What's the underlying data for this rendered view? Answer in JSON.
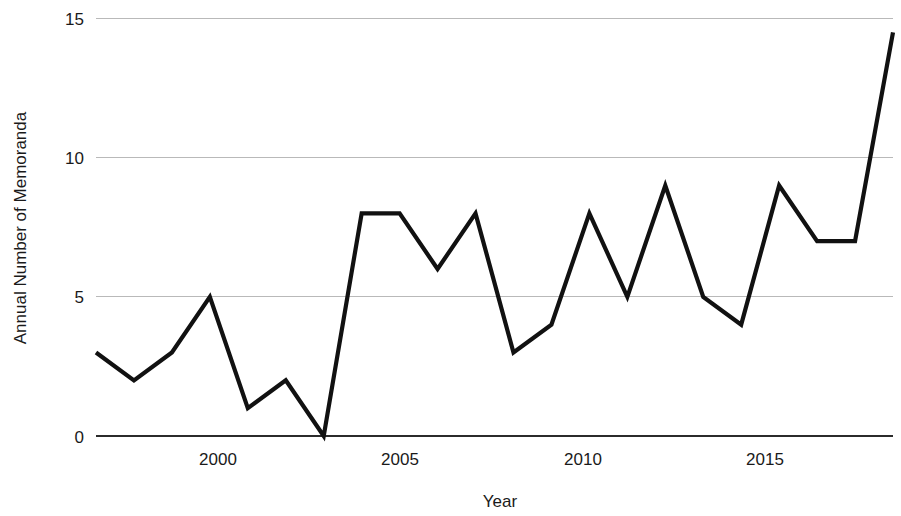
{
  "chart_data": {
    "type": "line",
    "title": "",
    "xlabel": "Year",
    "ylabel": "Annual Number of Memoranda",
    "x": [
      1997,
      1998,
      1999,
      2000,
      2001,
      2002,
      2003,
      2004,
      2005,
      2006,
      2007,
      2008,
      2009,
      2010,
      2011,
      2012,
      2013,
      2014,
      2015,
      2016,
      2017,
      2018
    ],
    "values": [
      3,
      2,
      3,
      5,
      1,
      2,
      0,
      8,
      8,
      6,
      8,
      3,
      4,
      8,
      5,
      9,
      5,
      4,
      9,
      7,
      7,
      14.5
    ],
    "series": [
      {
        "name": "Annual Number of Memoranda",
        "values": [
          3,
          2,
          3,
          5,
          1,
          2,
          0,
          8,
          8,
          6,
          8,
          3,
          4,
          8,
          5,
          9,
          5,
          4,
          9,
          7,
          7,
          14.5
        ]
      }
    ],
    "xlim": [
      1997,
      2018
    ],
    "ylim": [
      0,
      15
    ],
    "x_ticks": [
      2000,
      2005,
      2010,
      2015
    ],
    "x_tick_labels": [
      "2000",
      "2005",
      "2010",
      "2015"
    ],
    "y_ticks": [
      0,
      5,
      10,
      15
    ],
    "y_tick_labels": [
      "0",
      "5",
      "10",
      "15"
    ],
    "grid": true,
    "grid_axis": "y",
    "legend": false,
    "legend_position": "none",
    "line_color": "#111111",
    "grid_color": "#b9b9b9",
    "axis_color": "#2b2b2b",
    "background_color": "#ffffff"
  },
  "labels": {
    "y_axis_title": "Annual Number of Memoranda",
    "x_axis_title": "Year",
    "y_tick_0": "0",
    "y_tick_5": "5",
    "y_tick_10": "10",
    "y_tick_15": "15",
    "x_tick_2000": "2000",
    "x_tick_2005": "2005",
    "x_tick_2010": "2010",
    "x_tick_2015": "2015"
  }
}
